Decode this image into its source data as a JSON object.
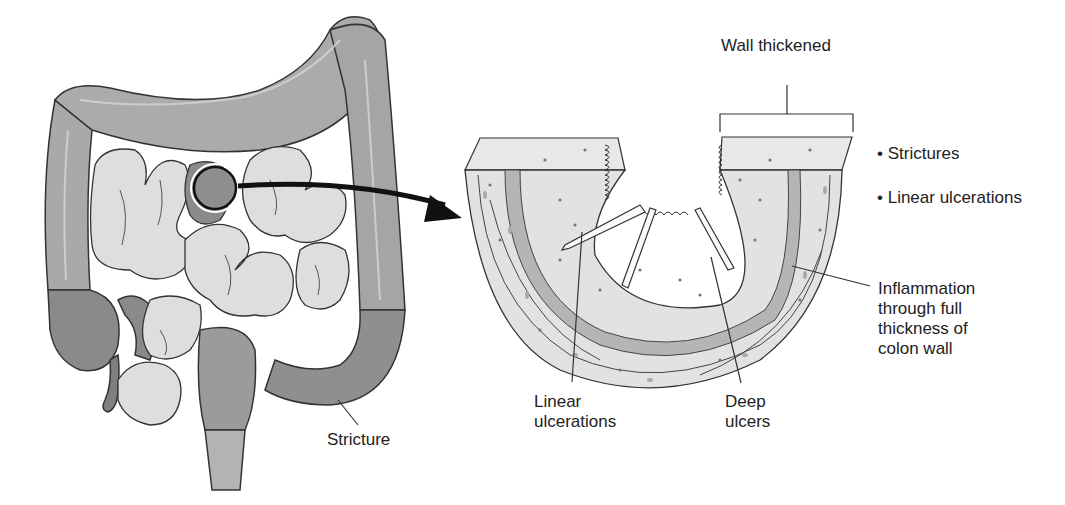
{
  "diagram": {
    "labels": {
      "wall_thickened": "Wall thickened",
      "bullets": [
        "Strictures",
        "Linear ulcerations"
      ],
      "inflammation": [
        "Inflammation",
        "through full",
        "thickness of",
        "colon wall"
      ],
      "linear_ulcerations": [
        "Linear",
        "ulcerations"
      ],
      "deep_ulcers": [
        "Deep",
        "ulcers"
      ],
      "stricture": "Stricture"
    },
    "colors": {
      "colon": "#a9a9a9",
      "small_intestine": "#dcdcdc",
      "diseased": "#8c8c8c",
      "outline": "#333333",
      "tissue_light": "#e4e4e4",
      "tissue_band": "#b5b5b5",
      "arrow": "#111111"
    }
  }
}
